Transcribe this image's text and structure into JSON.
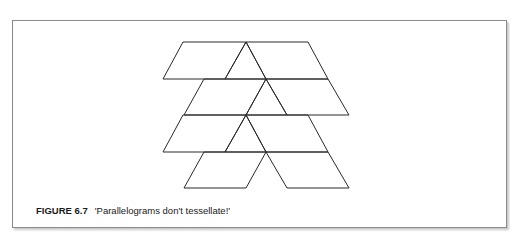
{
  "figure": {
    "label": "FIGURE 6.7",
    "caption": "'Parallelograms don't tessellate!'",
    "stroke_color": "#2a2a2a",
    "border_color": "#8a8a8a"
  },
  "tiling": {
    "rows": 4,
    "shapes": [
      {
        "row": 1,
        "kind": "parallelogram",
        "side": "left"
      },
      {
        "row": 1,
        "kind": "triangle",
        "side": "center"
      },
      {
        "row": 1,
        "kind": "parallelogram",
        "side": "right"
      },
      {
        "row": 2,
        "kind": "parallelogram",
        "side": "left"
      },
      {
        "row": 2,
        "kind": "triangle",
        "side": "center"
      },
      {
        "row": 2,
        "kind": "parallelogram",
        "side": "right"
      },
      {
        "row": 3,
        "kind": "parallelogram",
        "side": "left"
      },
      {
        "row": 3,
        "kind": "triangle",
        "side": "center"
      },
      {
        "row": 3,
        "kind": "parallelogram",
        "side": "right"
      },
      {
        "row": 4,
        "kind": "parallelogram",
        "side": "left"
      },
      {
        "row": 4,
        "kind": "parallelogram",
        "side": "right"
      }
    ]
  }
}
